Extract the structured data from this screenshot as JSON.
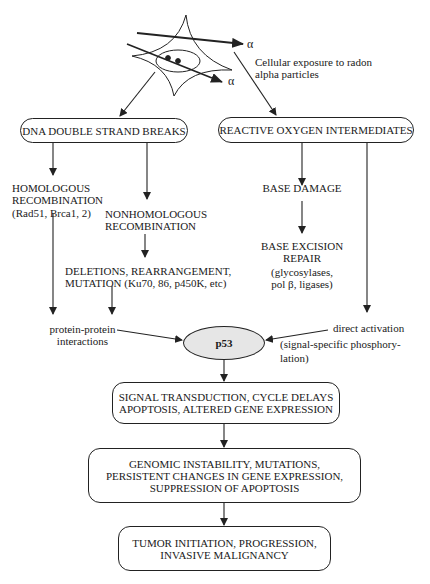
{
  "diagram": {
    "source": {
      "alpha_label_1": "α",
      "alpha_label_2": "α",
      "caption_line1": "Cellular exposure to radon",
      "caption_line2": "alpha particles"
    },
    "nodes": {
      "dna_dsb": "DNA DOUBLE STRAND BREAKS",
      "roi": "REACTIVE OXYGEN INTERMEDIATES",
      "homologous": {
        "line1": "HOMOLOGOUS",
        "line2": "RECOMBINATION",
        "line3": "(Rad51, Brca1, 2)"
      },
      "nonhomologous": {
        "line1": "NONHOMOLOGOUS",
        "line2": "RECOMBINATION"
      },
      "deletions": {
        "line1": "DELETIONS, REARRANGEMENT,",
        "line2": "MUTATION (Ku70, 86, p450K, etc)"
      },
      "base_damage": "BASE DAMAGE",
      "base_excision": {
        "line1": "BASE EXCISION",
        "line2": "REPAIR",
        "line3": "(glycosylases,",
        "line4": "pol β, ligases)"
      },
      "protein_protein": {
        "line1": "protein-protein",
        "line2": "interactions"
      },
      "direct_activation": {
        "line1": "direct activation",
        "line2": "(signal-specific phosphory-",
        "line3": "lation)"
      },
      "p53": "p53",
      "signal": {
        "line1": "SIGNAL TRANSDUCTION, CYCLE DELAYS",
        "line2": "APOPTOSIS, ALTERED GENE EXPRESSION"
      },
      "genomic": {
        "line1": "GENOMIC INSTABILITY, MUTATIONS,",
        "line2": "PERSISTENT CHANGES IN GENE EXPRESSION,",
        "line3": "SUPPRESSION OF APOPTOSIS"
      },
      "tumor": {
        "line1": "TUMOR INITIATION, PROGRESSION,",
        "line2": "INVASIVE MALIGNANCY"
      }
    },
    "colors": {
      "line": "#222222",
      "p53_fill": "#e6e6e6",
      "background": "#ffffff"
    }
  }
}
